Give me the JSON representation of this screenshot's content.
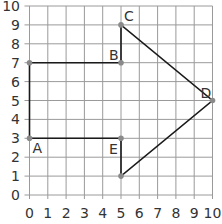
{
  "diagram": {
    "type": "coordinate-grid-shape",
    "x_axis": {
      "min": 0,
      "max": 10,
      "ticks": [
        "0",
        "1",
        "2",
        "3",
        "4",
        "5",
        "6",
        "7",
        "8",
        "9",
        "10"
      ]
    },
    "y_axis": {
      "min": 0,
      "max": 10,
      "ticks": [
        "0",
        "1",
        "2",
        "3",
        "4",
        "5",
        "6",
        "7",
        "8",
        "9",
        "10"
      ]
    },
    "shape_vertices": [
      [
        0,
        7
      ],
      [
        5,
        7
      ],
      [
        5,
        9
      ],
      [
        10,
        5
      ],
      [
        5,
        1
      ],
      [
        5,
        3
      ],
      [
        0,
        3
      ]
    ],
    "labeled_points": [
      {
        "label": "A",
        "x": 0,
        "y": 3,
        "dx": 3,
        "dy": 15
      },
      {
        "label": "B",
        "x": 5,
        "y": 7,
        "dx": -12,
        "dy": -3
      },
      {
        "label": "C",
        "x": 5,
        "y": 9,
        "dx": 3,
        "dy": -4
      },
      {
        "label": "D",
        "x": 10,
        "y": 5,
        "dx": -12,
        "dy": -3
      },
      {
        "label": "E",
        "x": 5,
        "y": 3,
        "dx": -12,
        "dy": 16
      }
    ],
    "unlabeled_points": [
      [
        0,
        7
      ],
      [
        5,
        1
      ]
    ],
    "colors": {
      "grid": "#9a9a9a",
      "shape": "#1a1a1a",
      "point": "#8a8a8a",
      "text": "#333333"
    }
  }
}
